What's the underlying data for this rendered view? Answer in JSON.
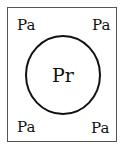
{
  "diagram": {
    "frame": {
      "x": 7,
      "y": 7,
      "width": 110,
      "height": 135,
      "stroke": "#555555"
    },
    "circle": {
      "cx": 63,
      "cy": 75,
      "rx": 37,
      "ry": 39,
      "stroke": "#111111",
      "label": "Pr"
    },
    "corner_labels": [
      {
        "position": "top-left",
        "text": "Pa"
      },
      {
        "position": "top-right",
        "text": "Pa"
      },
      {
        "position": "bottom-left",
        "text": "Pa"
      },
      {
        "position": "bottom-right",
        "text": "Pa"
      }
    ]
  }
}
